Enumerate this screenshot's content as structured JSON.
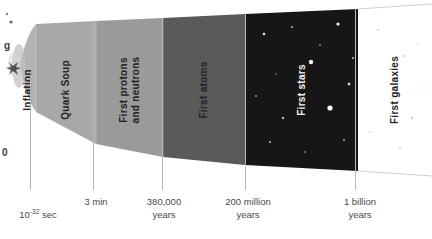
{
  "figure": {
    "type": "cosmic-timeline",
    "background_color": "#ffffff"
  },
  "epochs": [
    {
      "id": "inflation",
      "label": "Inflation",
      "color": "#b4b4b4",
      "text_color": "#232323",
      "x": 20,
      "width": 16
    },
    {
      "id": "quark-soup",
      "label": "Quark Soup",
      "color": "#a8a8a8",
      "text_color": "#232323",
      "x": 36,
      "width": 60
    },
    {
      "id": "first-protons-and-neutrons",
      "label": "First protons\nand neutrons",
      "color": "#9a9a9a",
      "text_color": "#232323",
      "x": 96,
      "width": 67
    },
    {
      "id": "first-atoms",
      "label": "First atoms",
      "color": "#5a5a5a",
      "text_color": "#1e1e1e",
      "x": 163,
      "width": 82
    },
    {
      "id": "first-stars",
      "label": "First stars",
      "color": "#161616",
      "text_color": "#f2f2f2",
      "x": 245,
      "width": 113
    },
    {
      "id": "first-galaxies",
      "label": "First galaxies",
      "color": "#ffffff",
      "text_color": "#232323",
      "x": 358,
      "width": 74
    }
  ],
  "axis": {
    "ticks": [
      {
        "id": "tick-inflation-end",
        "x": 30,
        "label": "10",
        "exponent": "-32",
        "suffix": " sec",
        "plain": "10^-32 sec"
      },
      {
        "id": "tick-3-min",
        "x": 93,
        "label": "3 min",
        "exponent": "",
        "suffix": "",
        "plain": "3 min"
      },
      {
        "id": "tick-380000-years",
        "x": 162,
        "label": "380,000\nyears",
        "exponent": "",
        "suffix": "",
        "plain": "380,000 years"
      },
      {
        "id": "tick-200-million",
        "x": 245,
        "label": "200 million\nyears",
        "exponent": "",
        "suffix": "",
        "plain": "200 million years"
      },
      {
        "id": "tick-1-billion",
        "x": 355,
        "label": "1 billion\nyears",
        "exponent": "",
        "suffix": "",
        "plain": "1 billion years"
      }
    ],
    "line_color": "#b9b9b9",
    "text_color": "#4a4a4a"
  },
  "cropped_fragments": [
    {
      "id": "frag-g",
      "text": "g",
      "x": 4,
      "y": 40
    },
    {
      "id": "frag-0",
      "text": "0",
      "x": 2,
      "y": 147
    }
  ]
}
